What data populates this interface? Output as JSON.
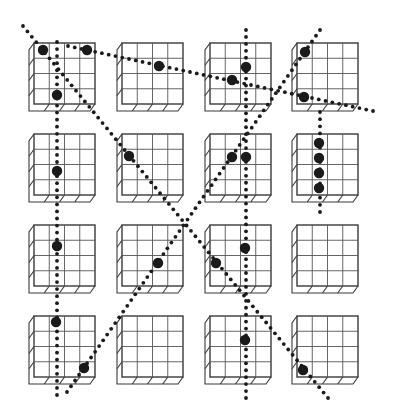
{
  "figure": {
    "colors": {
      "background": "#ffffff",
      "outline": "#3a3a3a",
      "marker": "#1a1a1a"
    },
    "grid_size": 4,
    "box_columns_x": [
      34,
      122,
      210,
      297
    ],
    "box_rows_y": [
      43,
      134,
      225,
      316
    ],
    "box_size": 61,
    "depth_offset": {
      "dx": -5,
      "dy": 7
    },
    "boxes": [
      {
        "row": 0,
        "col": 0,
        "markers": [
          [
            43,
            50
          ],
          [
            87,
            50
          ],
          [
            57,
            95
          ]
        ]
      },
      {
        "row": 0,
        "col": 1,
        "markers": [
          [
            159,
            66
          ]
        ]
      },
      {
        "row": 0,
        "col": 2,
        "markers": [
          [
            246,
            67
          ],
          [
            232,
            80
          ]
        ]
      },
      {
        "row": 0,
        "col": 3,
        "markers": [
          [
            305,
            52
          ],
          [
            304,
            97
          ]
        ]
      },
      {
        "row": 1,
        "col": 0,
        "markers": [
          [
            57,
            171
          ]
        ]
      },
      {
        "row": 1,
        "col": 1,
        "markers": [
          [
            129,
            156
          ]
        ]
      },
      {
        "row": 1,
        "col": 2,
        "markers": [
          [
            232,
            157
          ],
          [
            246,
            157
          ]
        ]
      },
      {
        "row": 1,
        "col": 3,
        "markers": [
          [
            319,
            143
          ],
          [
            319,
            158
          ],
          [
            319,
            173
          ],
          [
            319,
            188
          ]
        ]
      },
      {
        "row": 2,
        "col": 0,
        "markers": [
          [
            57,
            246
          ]
        ]
      },
      {
        "row": 2,
        "col": 1,
        "markers": [
          [
            158,
            263
          ]
        ]
      },
      {
        "row": 2,
        "col": 2,
        "markers": [
          [
            216,
            263
          ],
          [
            245,
            248
          ]
        ]
      },
      {
        "row": 2,
        "col": 3,
        "markers": []
      },
      {
        "row": 3,
        "col": 0,
        "markers": [
          [
            56,
            322
          ],
          [
            84,
            368
          ]
        ]
      },
      {
        "row": 3,
        "col": 1,
        "markers": []
      },
      {
        "row": 3,
        "col": 2,
        "markers": [
          [
            245,
            340
          ]
        ]
      },
      {
        "row": 3,
        "col": 3,
        "markers": [
          [
            303,
            370
          ]
        ]
      }
    ],
    "dotted_lines": [
      {
        "name": "vertical-column-1",
        "from": [
          57,
          42
        ],
        "to": [
          57,
          395
        ]
      },
      {
        "name": "diagonal-down-right",
        "from": [
          23,
          26
        ],
        "to": [
          328,
          398
        ]
      },
      {
        "name": "shallow-diagonal",
        "from": [
          68,
          46
        ],
        "to": [
          373,
          111
        ]
      },
      {
        "name": "vertical-column-3",
        "from": [
          246,
          30
        ],
        "to": [
          246,
          398
        ]
      },
      {
        "name": "diagonal-down-left",
        "from": [
          320,
          30
        ],
        "to": [
          67,
          392
        ]
      },
      {
        "name": "vertical-column-4",
        "from": [
          320,
          112
        ],
        "to": [
          320,
          212
        ]
      }
    ],
    "dot_spacing": 7,
    "dot_radius": 1.9,
    "marker_radius": 5.2
  }
}
